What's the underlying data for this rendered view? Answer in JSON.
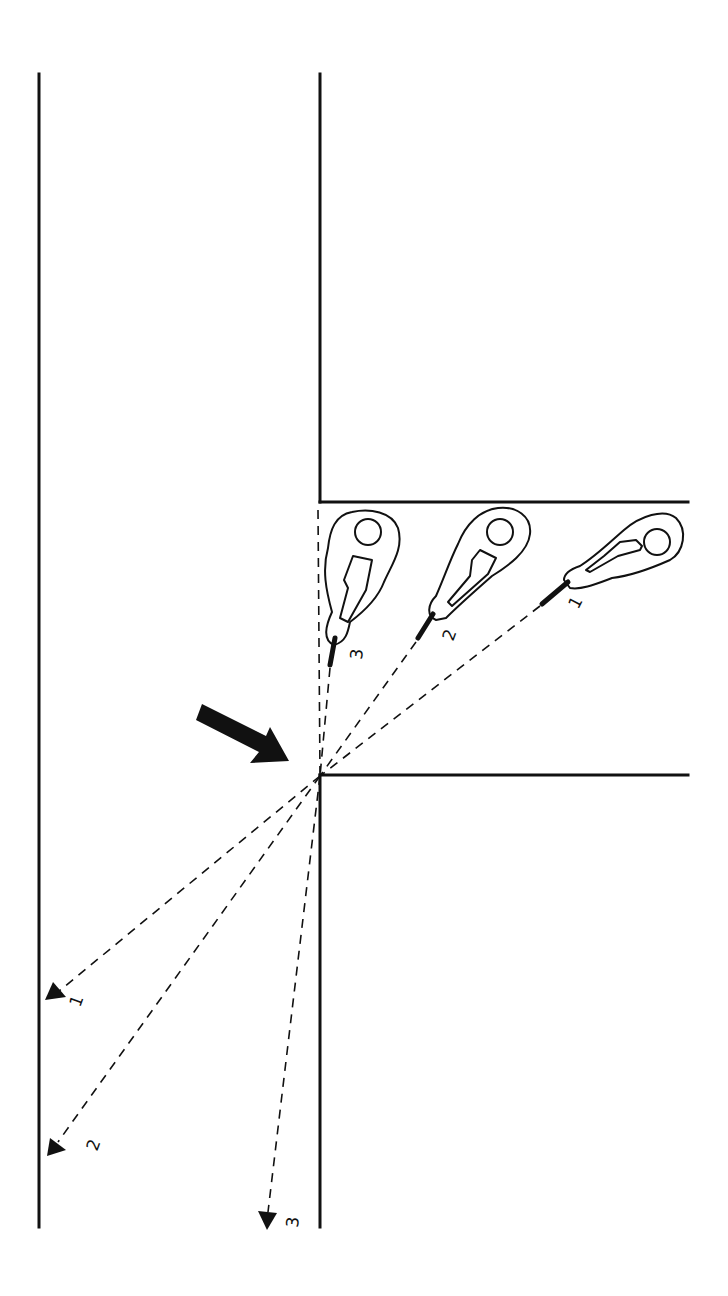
{
  "diagram": {
    "type": "corner-clearing-fields-of-fire",
    "background": "#ffffff",
    "ink_color": "#111111",
    "positions": [
      {
        "id": 1,
        "label": "1",
        "head": [
          657,
          542
        ],
        "gun": [
          [
            568,
            582
          ],
          [
            542,
            604
          ]
        ],
        "label_pos": [
          578,
          610
        ],
        "label_rotate": -62,
        "fire_target": [
          45,
          1000
        ],
        "target_label_pos": [
          74,
          1006
        ]
      },
      {
        "id": 2,
        "label": "2",
        "head": [
          500,
          532
        ],
        "gun": [
          [
            433,
            614
          ],
          [
            418,
            638
          ]
        ],
        "label_pos": [
          447,
          638
        ],
        "label_rotate": -62,
        "fire_target": [
          47,
          1155
        ],
        "target_label_pos": [
          92,
          1146
        ]
      },
      {
        "id": 3,
        "label": "3",
        "head": [
          368,
          532
        ],
        "gun": [
          [
            335,
            638
          ],
          [
            330,
            665
          ]
        ],
        "label_pos": [
          354,
          655
        ],
        "label_rotate": -80,
        "fire_target": [
          267,
          1229
        ],
        "target_label_pos": [
          290,
          1223
        ]
      }
    ],
    "pivot_point": [
      320,
      776
    ],
    "movement_arrow": {
      "from": [
        198,
        712
      ],
      "to": [
        288,
        760
      ]
    },
    "labels": {
      "pos1": "1",
      "pos2": "2",
      "pos3": "3",
      "target1": "1",
      "target2": "2",
      "target3": "3"
    }
  }
}
